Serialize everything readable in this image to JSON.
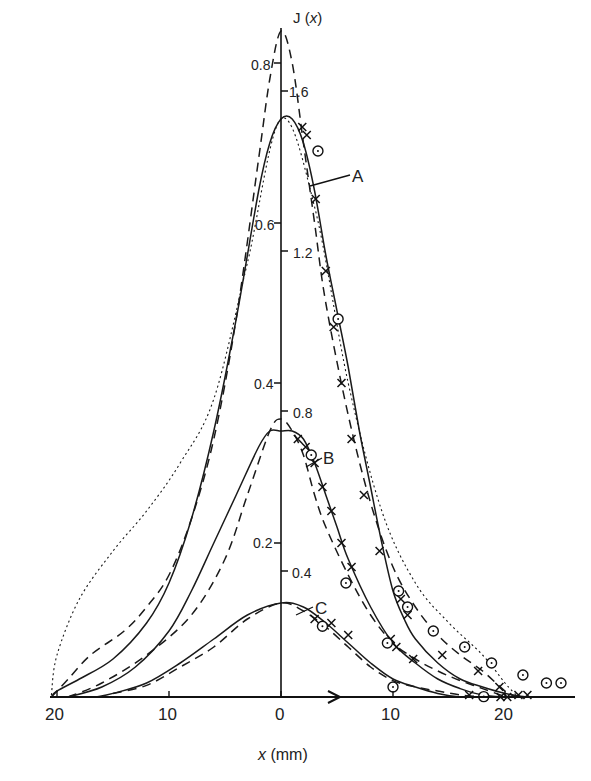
{
  "chart_data": {
    "type": "line",
    "title": "",
    "ylabel": "J (x)",
    "xlabel": "x (mm)",
    "x_unit": "mm",
    "x_ticks": [
      {
        "value": -20,
        "label": "20"
      },
      {
        "value": -10,
        "label": "10"
      },
      {
        "value": 0,
        "label": "0"
      },
      {
        "value": 10,
        "label": "10"
      },
      {
        "value": 20,
        "label": "20"
      }
    ],
    "y_ticks_left": [
      {
        "value": 0.2,
        "label": "0.2"
      },
      {
        "value": 0.4,
        "label": "0.4"
      },
      {
        "value": 0.6,
        "label": "0.6"
      },
      {
        "value": 0.8,
        "label": "0.8"
      }
    ],
    "y_ticks_right": [
      {
        "value": 0.4,
        "label": "0.4"
      },
      {
        "value": 0.8,
        "label": "0.8"
      },
      {
        "value": 1.2,
        "label": "1.2"
      },
      {
        "value": 1.6,
        "label": "1.6"
      }
    ],
    "xlim": [
      -20.5,
      25.5
    ],
    "ylim": [
      0,
      0.88
    ],
    "grid": false,
    "legend": "none",
    "annotations": [
      {
        "text": "A",
        "x": 6.4,
        "y": 0.75
      },
      {
        "text": "B",
        "x": 4.2,
        "y": 0.345
      },
      {
        "text": "C",
        "x": 3.0,
        "y": 0.11
      }
    ],
    "series": [
      {
        "name": "A-solid",
        "style": "solid",
        "x": [
          -20.5,
          -20,
          -18,
          -15,
          -12,
          -10,
          -8,
          -6,
          -4,
          -2,
          -1,
          0,
          1,
          2,
          3,
          4,
          5,
          6,
          7,
          8,
          9,
          10,
          11,
          12,
          14,
          16,
          18,
          20,
          22,
          25
        ],
        "y": [
          0,
          0.015,
          0.03,
          0.055,
          0.1,
          0.15,
          0.23,
          0.34,
          0.48,
          0.64,
          0.7,
          0.73,
          0.73,
          0.7,
          0.64,
          0.56,
          0.49,
          0.42,
          0.34,
          0.27,
          0.2,
          0.14,
          0.105,
          0.08,
          0.05,
          0.03,
          0.02,
          0.012,
          0.006,
          0.003
        ]
      },
      {
        "name": "A-dashed",
        "style": "dashed",
        "x": [
          -20.5,
          -19,
          -17,
          -14,
          -12,
          -10,
          -8,
          -6,
          -4,
          -2,
          -1,
          0,
          1,
          2,
          3,
          4,
          6,
          8,
          10,
          12,
          14,
          16,
          18,
          20,
          21
        ],
        "y": [
          0,
          0.03,
          0.06,
          0.09,
          0.12,
          0.16,
          0.23,
          0.33,
          0.48,
          0.68,
          0.78,
          0.84,
          0.8,
          0.7,
          0.6,
          0.5,
          0.36,
          0.25,
          0.17,
          0.12,
          0.085,
          0.06,
          0.04,
          0.015,
          0
        ]
      },
      {
        "name": "A-dotted",
        "style": "dotted",
        "x": [
          -20.5,
          -20,
          -18,
          -15,
          -12,
          -9,
          -6,
          -3,
          0,
          3,
          6,
          9,
          12,
          15,
          18,
          20,
          21
        ],
        "y": [
          0.01,
          0.06,
          0.13,
          0.19,
          0.24,
          0.3,
          0.38,
          0.55,
          0.73,
          0.62,
          0.4,
          0.24,
          0.15,
          0.1,
          0.06,
          0.025,
          0.01
        ]
      },
      {
        "name": "B-solid",
        "style": "solid",
        "x": [
          -19,
          -16,
          -13,
          -10,
          -8,
          -6,
          -4,
          -2,
          -1,
          0,
          1,
          2,
          3,
          4,
          5,
          6,
          8,
          10,
          12,
          14,
          16,
          18,
          20
        ],
        "y": [
          0.005,
          0.02,
          0.045,
          0.09,
          0.14,
          0.2,
          0.26,
          0.32,
          0.34,
          0.34,
          0.34,
          0.33,
          0.3,
          0.26,
          0.22,
          0.18,
          0.12,
          0.075,
          0.05,
          0.03,
          0.018,
          0.01,
          0.005
        ]
      },
      {
        "name": "B-dashed",
        "style": "dashed",
        "x": [
          -19,
          -16,
          -12,
          -8,
          -5,
          -3,
          -1,
          0,
          1,
          2,
          3,
          4,
          6,
          8,
          10,
          12,
          14,
          16,
          18,
          20
        ],
        "y": [
          0.005,
          0.025,
          0.06,
          0.11,
          0.18,
          0.26,
          0.34,
          0.355,
          0.34,
          0.31,
          0.26,
          0.22,
          0.16,
          0.11,
          0.075,
          0.055,
          0.04,
          0.028,
          0.018,
          0.008
        ]
      },
      {
        "name": "C-solid",
        "style": "solid",
        "x": [
          -16.5,
          -15,
          -12,
          -9,
          -6,
          -3,
          0,
          2,
          4,
          6,
          8,
          10,
          12,
          14,
          16,
          18,
          20
        ],
        "y": [
          0.005,
          0.012,
          0.025,
          0.05,
          0.08,
          0.11,
          0.125,
          0.12,
          0.1,
          0.075,
          0.05,
          0.03,
          0.02,
          0.012,
          0.007,
          0.004,
          0.002
        ]
      },
      {
        "name": "C-dashed",
        "style": "dashed",
        "x": [
          -15,
          -12,
          -9,
          -6,
          -3,
          0,
          2,
          4,
          6,
          8,
          10,
          12,
          14,
          16,
          18
        ],
        "y": [
          0.012,
          0.022,
          0.045,
          0.07,
          0.105,
          0.125,
          0.115,
          0.095,
          0.07,
          0.045,
          0.028,
          0.02,
          0.015,
          0.01,
          0.004
        ]
      },
      {
        "name": "A-measured-cross",
        "marker": "x",
        "x": [
          1.9,
          2.3,
          3.1,
          4.0,
          4.7,
          5.4,
          6.3,
          7.4,
          8.8,
          10.7,
          11.3,
          14.4,
          17.6,
          19.5,
          22
        ],
        "y": [
          0.72,
          0.71,
          0.63,
          0.54,
          0.47,
          0.4,
          0.33,
          0.26,
          0.19,
          0.13,
          0.11,
          0.06,
          0.04,
          0.02,
          0.01
        ]
      },
      {
        "name": "A-measured-circle",
        "marker": "o",
        "x": [
          3.3,
          5.1,
          10.5,
          11.3,
          13.6,
          16.4,
          18.8,
          21.6,
          23.7,
          25
        ],
        "y": [
          0.69,
          0.48,
          0.14,
          0.12,
          0.09,
          0.07,
          0.05,
          0.035,
          0.025,
          0.025
        ]
      },
      {
        "name": "B-measured-cross",
        "marker": "x",
        "x": [
          1.5,
          2.2,
          3.0,
          3.7,
          4.5,
          5.4,
          6.3,
          9.8,
          10.3,
          11.8,
          16.8,
          20.2
        ],
        "y": [
          0.33,
          0.32,
          0.3,
          0.27,
          0.24,
          0.2,
          0.17,
          0.08,
          0.07,
          0.055,
          0.01,
          0.006
        ]
      },
      {
        "name": "B-measured-circle",
        "marker": "o",
        "x": [
          2.7,
          5.8,
          9.5,
          18.1
        ],
        "y": [
          0.31,
          0.15,
          0.075,
          0.008
        ]
      },
      {
        "name": "C-measured-cross",
        "marker": "x",
        "x": [
          3.0,
          4.5,
          6.0,
          19.6,
          21.2
        ],
        "y": [
          0.105,
          0.1,
          0.085,
          0.005,
          0.01
        ]
      },
      {
        "name": "C-measured-circle",
        "marker": "o",
        "x": [
          3.7,
          10.0
        ],
        "y": [
          0.096,
          0.02
        ]
      }
    ]
  },
  "axis": {
    "y_title_prefix": "J (",
    "y_title_var": "x",
    "y_title_suffix": ")",
    "x_title_var": "x",
    "x_title_unit": " (mm)"
  }
}
